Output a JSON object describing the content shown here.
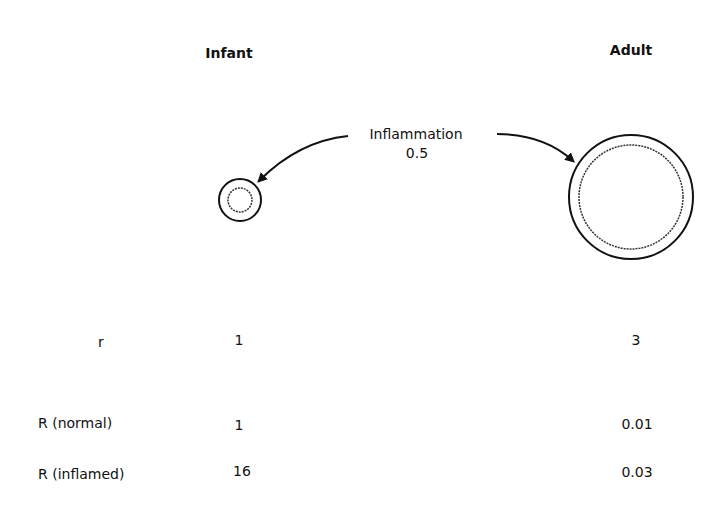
{
  "columns": {
    "infant": "Infant",
    "adult": "Adult"
  },
  "inflammation": {
    "label": "Inflammation",
    "value": "0.5"
  },
  "rows": [
    {
      "label": "r",
      "infant": "1",
      "adult": "3"
    },
    {
      "label": "R (normal)",
      "infant": "1",
      "adult": "0.01"
    },
    {
      "label": "R (inflamed)",
      "infant": "16",
      "adult": "0.03"
    }
  ],
  "icons": {
    "infant_airway": "airway-cross-section-small",
    "adult_airway": "airway-cross-section-large",
    "arrows": "curved-arrow"
  }
}
